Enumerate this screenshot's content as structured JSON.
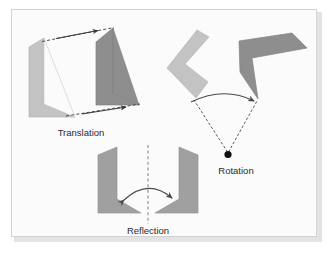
{
  "figure": {
    "background_color": "#ffffff",
    "panel_color": "#fbfbfb",
    "frame_border_color": "#d2d2d2",
    "shadow_color": "#e3e3e3"
  },
  "palette": {
    "shape_light": "#c3c3c3",
    "shape_light_edge": "#b4b4b4",
    "shape_dark": "#8e8e8e",
    "shape_dark_edge": "#838383",
    "shape_mid": "#a0a0a0",
    "line_color": "#3b3b3b",
    "pivot_color": "#111111",
    "label_color": "#2b2b2b",
    "mirror_line_color": "#9a9a9a"
  },
  "panels": [
    {
      "id": "translation",
      "label": "Translation",
      "label_x": 81,
      "label_y": 133,
      "description": "A light gray chevron shape is shifted along a constant vector to a darker gray congruent copy; two dashed vectors with arrowheads mark the displacement.",
      "pre_image_color": "#c3c3c3",
      "image_color": "#8e8e8e",
      "vectors": [
        {
          "name": "top-translation-vector",
          "x1": 42,
          "y1": 41,
          "x2": 112,
          "y2": 28
        },
        {
          "name": "bottom-translation-vector",
          "x1": 68,
          "y1": 115,
          "x2": 137,
          "y2": 101
        }
      ]
    },
    {
      "id": "rotation",
      "label": "Rotation",
      "label_x": 236,
      "label_y": 171,
      "description": "A light gray chevron is rotated about a fixed black pivot point to a darker gray image; dashed radii join each shape to the pivot and a curved arrow shows the turn direction.",
      "pre_image_color": "#c3c3c3",
      "image_color": "#8e8e8e",
      "pivot": {
        "name": "center-of-rotation",
        "x": 228,
        "y": 154,
        "r": 3.6
      },
      "radii": [
        {
          "name": "radius-pre-image",
          "x1": 228,
          "y1": 154,
          "x2": 193,
          "y2": 99
        },
        {
          "name": "radius-image",
          "x1": 228,
          "y1": 154,
          "x2": 258,
          "y2": 100
        }
      ],
      "arc_arrow": {
        "name": "rotation-arc-arrow",
        "from_x": 191,
        "from_y": 102,
        "to_x": 256,
        "to_y": 101
      }
    },
    {
      "id": "reflection",
      "label": "Reflection",
      "label_x": 148,
      "label_y": 231,
      "description": "Two congruent gray chevrons face each other across a vertical dashed mirror line; a double-headed curved arrow crosses the line to show the flip.",
      "pre_image_color": "#a0a0a0",
      "image_color": "#a0a0a0",
      "mirror_line": {
        "name": "mirror-axis",
        "x": 148,
        "y1": 147,
        "y2": 223
      },
      "arc_arrow": {
        "name": "reflection-arc-arrow",
        "left_x": 122,
        "left_y": 201,
        "right_x": 174,
        "right_y": 198
      }
    }
  ],
  "labels": {
    "translation": "Translation",
    "rotation": "Rotation",
    "reflection": "Reflection"
  }
}
